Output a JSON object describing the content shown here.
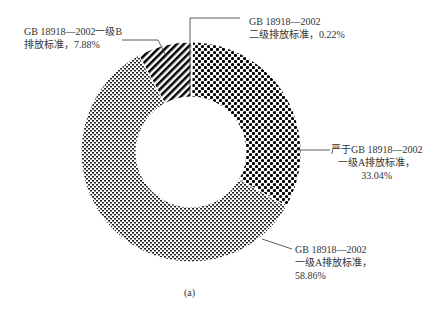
{
  "chart_data": {
    "type": "pie",
    "variant": "donut",
    "title": "",
    "caption": "(a)",
    "categories": [
      "GB 18918—2002二级排放标准",
      "严于GB 18918—2002一级A排放标准",
      "GB 18918—2002一级A排放标准",
      "GB 18918—2002一级B排放标准"
    ],
    "values": [
      0.22,
      33.04,
      58.86,
      7.88
    ],
    "unit": "%",
    "patterns": [
      "checker-dots",
      "checker-dots",
      "fine-checker",
      "diagonal-stripes"
    ],
    "start_angle": "12 o'clock, clockwise"
  },
  "labels": {
    "grade2": {
      "line1": "GB 18918—2002",
      "line2": "二级排放标准，0.22%"
    },
    "stricter": {
      "line1": "严于GB 18918—2002",
      "line2": "一级A排放标准，",
      "line3": "33.04%"
    },
    "grade1a": {
      "line1": "GB 18918—2002",
      "line2": "一级A排放标准，",
      "line3": "58.86%"
    },
    "grade1b": {
      "line1": "GB 18918—2002一级B",
      "line2": "排放标准，7.88%"
    }
  },
  "caption": "(a)"
}
